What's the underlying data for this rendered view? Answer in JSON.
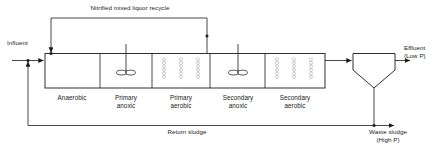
{
  "diagram": {
    "type": "process-flow-diagram",
    "colors": {
      "line": "#1a1a1a",
      "text": "#1a1a1a",
      "background": "#ffffff",
      "diffuser": "#9a9a9a"
    }
  },
  "streams": {
    "influent": "Influent",
    "recycle": "Nitrified mixed liquor recycle",
    "return_sludge": "Return sludge",
    "effluent_line1": "Effluent",
    "effluent_line2": "(Low P)",
    "waste_sludge_line1": "Waste sludge",
    "waste_sludge_line2": "(High P)"
  },
  "zones": [
    {
      "id": "anaerobic",
      "label_line1": "Anaerobic",
      "label_line2": "",
      "equipment": "none"
    },
    {
      "id": "primary-anoxic",
      "label_line1": "Primary",
      "label_line2": "anoxic",
      "equipment": "mixer"
    },
    {
      "id": "primary-aerobic",
      "label_line1": "Primary",
      "label_line2": "aerobic",
      "equipment": "diffusers"
    },
    {
      "id": "secondary-anoxic",
      "label_line1": "Secondary",
      "label_line2": "anoxic",
      "equipment": "mixer"
    },
    {
      "id": "secondary-aerobic",
      "label_line1": "Secondary",
      "label_line2": "aerobic",
      "equipment": "diffusers"
    }
  ],
  "units": {
    "clarifier": "secondary-clarifier"
  }
}
